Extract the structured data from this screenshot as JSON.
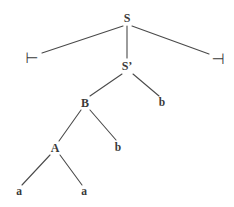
{
  "figure": {
    "kind": "parse-tree",
    "background_color": "#ffffff",
    "ink_color": "#3a3a3a",
    "edge_color": "#4a4a4a",
    "width": 234,
    "height": 207
  },
  "nodes": [
    {
      "id": "S",
      "label": "S",
      "x": 127,
      "y": 18,
      "kind": "nonterminal"
    },
    {
      "id": "LEFTEND",
      "label": "⊢",
      "x": 32,
      "y": 58,
      "kind": "endmarker"
    },
    {
      "id": "SPRIME",
      "label": "S’",
      "x": 127,
      "y": 66,
      "kind": "nonterminal"
    },
    {
      "id": "RIGHTEND",
      "label": "⊣",
      "x": 218,
      "y": 59,
      "kind": "endmarker"
    },
    {
      "id": "B",
      "label": "B",
      "x": 85,
      "y": 103,
      "kind": "nonterminal"
    },
    {
      "id": "b1",
      "label": "b",
      "x": 162,
      "y": 103,
      "kind": "terminal"
    },
    {
      "id": "A",
      "label": "A",
      "x": 55,
      "y": 148,
      "kind": "nonterminal"
    },
    {
      "id": "b2",
      "label": "b",
      "x": 118,
      "y": 148,
      "kind": "terminal"
    },
    {
      "id": "a1",
      "label": "a",
      "x": 19,
      "y": 192,
      "kind": "terminal"
    },
    {
      "id": "a2",
      "label": "a",
      "x": 84,
      "y": 192,
      "kind": "terminal"
    }
  ],
  "edges": [
    {
      "from": "S",
      "to": "LEFTEND",
      "x1": 123,
      "y1": 26,
      "x2": 42,
      "y2": 53
    },
    {
      "from": "S",
      "to": "SPRIME",
      "x1": 127,
      "y1": 26,
      "x2": 127,
      "y2": 58
    },
    {
      "from": "S",
      "to": "RIGHTEND",
      "x1": 132,
      "y1": 26,
      "x2": 209,
      "y2": 54
    },
    {
      "from": "SPRIME",
      "to": "B",
      "x1": 122,
      "y1": 74,
      "x2": 90,
      "y2": 96
    },
    {
      "from": "SPRIME",
      "to": "b1",
      "x1": 133,
      "y1": 74,
      "x2": 159,
      "y2": 96
    },
    {
      "from": "B",
      "to": "A",
      "x1": 81,
      "y1": 110,
      "x2": 59,
      "y2": 141
    },
    {
      "from": "B",
      "to": "b2",
      "x1": 90,
      "y1": 110,
      "x2": 116,
      "y2": 140
    },
    {
      "from": "A",
      "to": "a1",
      "x1": 50,
      "y1": 155,
      "x2": 22,
      "y2": 185
    },
    {
      "from": "A",
      "to": "a2",
      "x1": 60,
      "y1": 155,
      "x2": 82,
      "y2": 185
    }
  ]
}
